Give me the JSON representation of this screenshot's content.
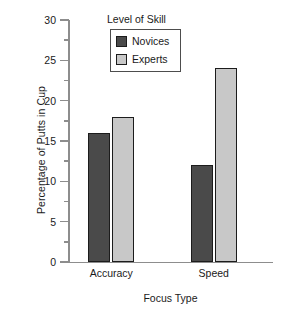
{
  "chart_data": {
    "type": "bar",
    "title": "",
    "xlabel": "Focus Type",
    "ylabel": "Percentage of Putts in Cup",
    "categories": [
      "Accuracy",
      "Speed"
    ],
    "series": [
      {
        "name": "Novices",
        "values": [
          16,
          18
        ],
        "color": "#4a4a4a"
      },
      {
        "name": "Experts",
        "values": [
          12,
          24
        ],
        "color": "#c8c8c8"
      }
    ],
    "grouped_values": {
      "Accuracy": {
        "Novices": 16,
        "Experts": 18
      },
      "Speed": {
        "Novices": 12,
        "Experts": 24
      }
    },
    "ylim": [
      0,
      30
    ],
    "ytick_labels": [
      "0",
      "5",
      "10",
      "15",
      "20",
      "25",
      "30"
    ],
    "ytick_values": [
      0,
      5,
      10,
      15,
      20,
      25,
      30
    ],
    "yminor_ticks": [
      2.5,
      7.5,
      12.5,
      17.5,
      22.5,
      27.5
    ],
    "grid": false,
    "legend": {
      "title": "Level of Skill",
      "position": "top-center-inside",
      "entries": [
        {
          "label": "Novices",
          "color": "#4a4a4a"
        },
        {
          "label": "Experts",
          "color": "#c8c8c8"
        }
      ]
    },
    "bar_edge_color": "#1c1c1c",
    "axis_color": "#8d8d8d",
    "background": "#ffffff"
  }
}
